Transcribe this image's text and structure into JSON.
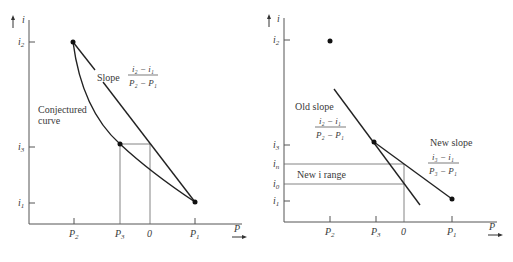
{
  "left_panel": {
    "y_axis_label": "i",
    "x_axis_label": "P",
    "y_ticks": [
      {
        "base": "i",
        "sub": "2"
      },
      {
        "base": "i",
        "sub": "3"
      },
      {
        "base": "i",
        "sub": "1"
      }
    ],
    "x_ticks": [
      {
        "base": "P",
        "sub": "2"
      },
      {
        "base": "P",
        "sub": "3"
      },
      {
        "base": "0",
        "sub": ""
      },
      {
        "base": "P",
        "sub": "1"
      }
    ],
    "slope_label": "Slope",
    "slope_fraction": {
      "numerator": "i₂ − i₁",
      "denominator": "P₂ − P₁"
    },
    "curve_label_line1": "Conjectured",
    "curve_label_line2": "curve"
  },
  "right_panel": {
    "y_axis_label": "i",
    "x_axis_label": "P",
    "y_ticks": [
      {
        "base": "i",
        "sub": "2"
      },
      {
        "base": "i",
        "sub": "3"
      },
      {
        "base": "i",
        "sub": "n"
      },
      {
        "base": "i",
        "sub": "0"
      },
      {
        "base": "i",
        "sub": "1"
      }
    ],
    "x_ticks": [
      {
        "base": "P",
        "sub": "2"
      },
      {
        "base": "P",
        "sub": "3"
      },
      {
        "base": "0",
        "sub": ""
      },
      {
        "base": "P",
        "sub": "1"
      }
    ],
    "old_slope_label": "Old slope",
    "old_slope_fraction": {
      "numerator": "i₂ − i₁",
      "denominator": "P₂ − P₁"
    },
    "new_slope_label": "New slope",
    "new_slope_fraction": {
      "numerator": "i₃ − i₁",
      "denominator": "P₃ − P₁"
    },
    "range_label": "New i range"
  }
}
